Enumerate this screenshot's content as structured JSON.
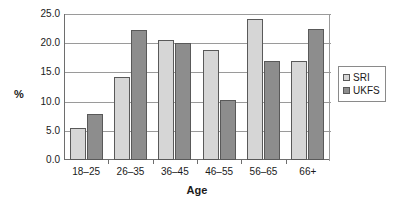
{
  "chart_data": {
    "type": "bar",
    "title": "",
    "xlabel": "Age",
    "ylabel": "%",
    "categories": [
      "18–25",
      "26–35",
      "36–45",
      "46–55",
      "56–65",
      "66+"
    ],
    "series": [
      {
        "name": "SRI",
        "color": "#d6d6d6",
        "values": [
          5.5,
          14.2,
          20.5,
          18.8,
          24.1,
          16.9
        ]
      },
      {
        "name": "UKFS",
        "color": "#8d8d8d",
        "values": [
          7.8,
          22.3,
          20.0,
          10.3,
          16.9,
          22.5
        ]
      }
    ],
    "ylim": [
      0.0,
      25.0
    ],
    "ytick_labels": [
      "0.0",
      "5.0",
      "10.0",
      "15.0",
      "20.0",
      "25.0"
    ],
    "ytick_values": [
      0.0,
      5.0,
      10.0,
      15.0,
      20.0,
      25.0
    ],
    "grid": "horizontal",
    "legend_position": "right"
  }
}
